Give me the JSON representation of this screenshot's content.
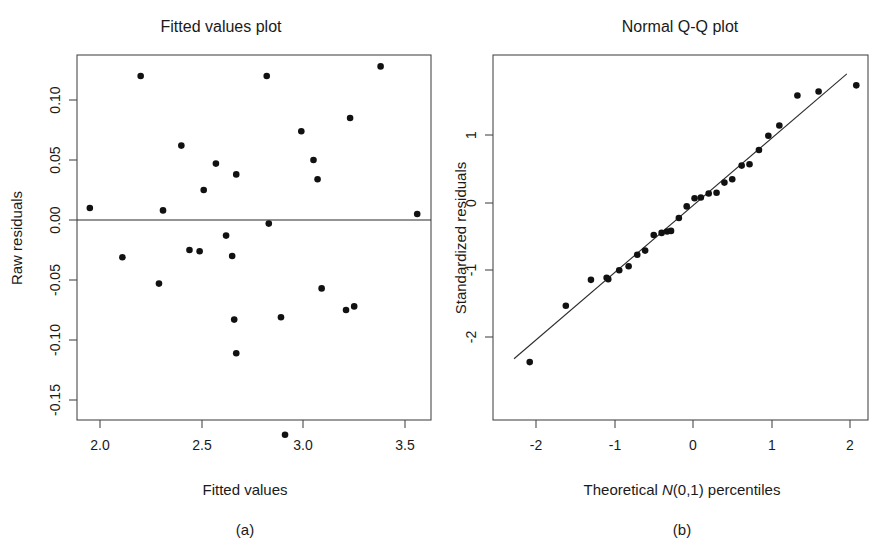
{
  "figure": {
    "background_color": "#ffffff",
    "point_color": "#111111",
    "axis_color": "#4a4a4a"
  },
  "panel_a": {
    "caption": "(a)",
    "title": "Fitted values plot",
    "xlabel": "Fitted values",
    "ylabel": "Raw residuals",
    "xticks": [
      "2.0",
      "2.5",
      "3.0",
      "3.5"
    ],
    "yticks": [
      "0.10",
      "0.05",
      "0.00",
      "-0.05",
      "-0.10",
      "-0.15"
    ]
  },
  "panel_b": {
    "caption": "(b)",
    "title": "Normal Q-Q plot",
    "xlabel_part1": "Theoretical ",
    "xlabel_italic": "N",
    "xlabel_part2": "(0,1) percentiles",
    "ylabel": "Standardized residuals",
    "xticks": [
      "-2",
      "-1",
      "0",
      "1",
      "2"
    ],
    "yticks": [
      "1",
      "0",
      "-1",
      "-2"
    ]
  },
  "chart_data": [
    {
      "type": "scatter",
      "id": "fitted-values-plot",
      "title": "Fitted values plot",
      "xlabel": "Fitted values",
      "ylabel": "Raw residuals",
      "xlim": [
        1.89,
        3.63
      ],
      "ylim": [
        -0.192,
        0.138
      ],
      "xticks": [
        2.0,
        2.5,
        3.0,
        3.5
      ],
      "yticks": [
        0.1,
        0.05,
        0.0,
        -0.05,
        -0.1,
        -0.15
      ],
      "grid": false,
      "legend": "none",
      "annotations": [
        "horizontal reference line at y = 0"
      ],
      "reference_line": {
        "type": "horizontal",
        "y": 0.0
      },
      "points": [
        {
          "x": 1.95,
          "y": 0.01
        },
        {
          "x": 2.11,
          "y": -0.031
        },
        {
          "x": 2.2,
          "y": 0.12
        },
        {
          "x": 2.29,
          "y": -0.053
        },
        {
          "x": 2.31,
          "y": 0.008
        },
        {
          "x": 2.4,
          "y": 0.062
        },
        {
          "x": 2.44,
          "y": -0.025
        },
        {
          "x": 2.49,
          "y": -0.026
        },
        {
          "x": 2.51,
          "y": 0.025
        },
        {
          "x": 2.57,
          "y": 0.047
        },
        {
          "x": 2.62,
          "y": -0.013
        },
        {
          "x": 2.65,
          "y": -0.03
        },
        {
          "x": 2.66,
          "y": -0.083
        },
        {
          "x": 2.67,
          "y": 0.038
        },
        {
          "x": 2.67,
          "y": -0.111
        },
        {
          "x": 2.82,
          "y": 0.12
        },
        {
          "x": 2.83,
          "y": -0.003
        },
        {
          "x": 2.89,
          "y": -0.081
        },
        {
          "x": 2.91,
          "y": -0.179
        },
        {
          "x": 2.99,
          "y": 0.074
        },
        {
          "x": 3.05,
          "y": 0.05
        },
        {
          "x": 3.07,
          "y": 0.034
        },
        {
          "x": 3.09,
          "y": -0.057
        },
        {
          "x": 3.21,
          "y": -0.075
        },
        {
          "x": 3.23,
          "y": 0.085
        },
        {
          "x": 3.25,
          "y": -0.072
        },
        {
          "x": 3.38,
          "y": 0.128
        },
        {
          "x": 3.56,
          "y": 0.005
        }
      ]
    },
    {
      "type": "scatter",
      "id": "normal-qq-plot",
      "title": "Normal Q-Q plot",
      "xlabel": "Theoretical N(0,1) percentiles",
      "ylabel": "Standardized residuals",
      "xlim": [
        -2.35,
        2.35
      ],
      "ylim": [
        -2.45,
        1.95
      ],
      "xticks": [
        -2,
        -1,
        0,
        1,
        2
      ],
      "yticks": [
        1,
        0,
        -1,
        -2
      ],
      "grid": false,
      "legend": "none",
      "annotations": [
        "reference line through quartiles"
      ],
      "reference_line": {
        "type": "qq-line",
        "x1": -2.28,
        "y1": -2.29,
        "x2": 1.96,
        "y2": 1.9
      },
      "points": [
        {
          "x": -2.08,
          "y": -2.34
        },
        {
          "x": -1.62,
          "y": -1.51
        },
        {
          "x": -1.3,
          "y": -1.13
        },
        {
          "x": -1.1,
          "y": -1.1
        },
        {
          "x": -1.08,
          "y": -1.12
        },
        {
          "x": -0.94,
          "y": -0.99
        },
        {
          "x": -0.82,
          "y": -0.93
        },
        {
          "x": -0.71,
          "y": -0.76
        },
        {
          "x": -0.61,
          "y": -0.7
        },
        {
          "x": -0.5,
          "y": -0.47
        },
        {
          "x": -0.4,
          "y": -0.44
        },
        {
          "x": -0.33,
          "y": -0.42
        },
        {
          "x": -0.28,
          "y": -0.41
        },
        {
          "x": -0.18,
          "y": -0.22
        },
        {
          "x": -0.08,
          "y": -0.05
        },
        {
          "x": 0.02,
          "y": 0.07
        },
        {
          "x": 0.1,
          "y": 0.08
        },
        {
          "x": 0.2,
          "y": 0.14
        },
        {
          "x": 0.3,
          "y": 0.15
        },
        {
          "x": 0.4,
          "y": 0.3
        },
        {
          "x": 0.5,
          "y": 0.35
        },
        {
          "x": 0.62,
          "y": 0.55
        },
        {
          "x": 0.72,
          "y": 0.57
        },
        {
          "x": 0.84,
          "y": 0.78
        },
        {
          "x": 0.96,
          "y": 0.99
        },
        {
          "x": 1.1,
          "y": 1.14
        },
        {
          "x": 1.33,
          "y": 1.58
        },
        {
          "x": 1.6,
          "y": 1.64
        },
        {
          "x": 2.08,
          "y": 1.73
        }
      ]
    }
  ]
}
